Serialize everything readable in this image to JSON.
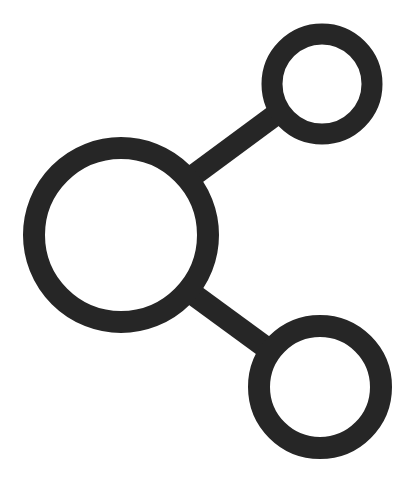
{
  "icon": {
    "name": "share-icon",
    "description": "Share / network icon: three ring nodes connected by two straight lines",
    "stroke_color": "#262626",
    "background_color": "#ffffff",
    "canvas": {
      "width": 411,
      "height": 488
    },
    "nodes": [
      {
        "id": "main",
        "cx": 121,
        "cy": 235,
        "r": 87,
        "stroke_width": 22
      },
      {
        "id": "top",
        "cx": 322,
        "cy": 84,
        "r": 50,
        "stroke_width": 21
      },
      {
        "id": "bottom",
        "cx": 320,
        "cy": 387,
        "r": 61,
        "stroke_width": 22
      }
    ],
    "connectors": [
      {
        "from": "main",
        "to": "top",
        "x1": 190,
        "y1": 178,
        "x2": 278,
        "y2": 113,
        "stroke_width": 22
      },
      {
        "from": "main",
        "to": "bottom",
        "x1": 190,
        "y1": 292,
        "x2": 272,
        "y2": 352,
        "stroke_width": 22
      }
    ]
  }
}
